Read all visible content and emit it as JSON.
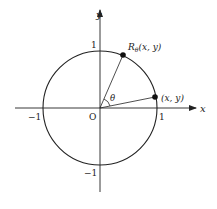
{
  "diagram": {
    "axes": {
      "x_label": "x",
      "y_label": "y",
      "origin_label": "O"
    },
    "ticks": {
      "x_pos": "1",
      "x_neg": "−1",
      "y_pos": "1",
      "y_neg": "−1"
    },
    "points": {
      "original": "(x, y)",
      "rotated_prefix": "R",
      "rotated_sub": "θ",
      "rotated_suffix": "(x, y)"
    },
    "angle_label": "θ",
    "colors": {
      "stroke": "#222222",
      "background": "#ffffff"
    }
  }
}
